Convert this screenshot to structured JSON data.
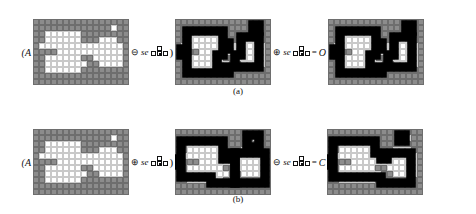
{
  "figure": {
    "domain_note": "morphological opening and closing illustration",
    "cell_px": 6,
    "grid_cols": 16,
    "grid_rows": 11,
    "colors": {
      "background_cell": "#8c8c8c",
      "foreground_cell": "#ffffff",
      "gridline": "#6e6e6e",
      "contour": "#000000",
      "page": "#ffffff"
    }
  },
  "rows": [
    {
      "id": "row-a",
      "caption": "(a)",
      "lead_label": "(A",
      "operators": [
        {
          "id": "op-a-1",
          "symbol": "⊖",
          "symbol_name": "erosion-symbol",
          "se_text": "se",
          "trailing": ")",
          "equals": "",
          "result": ""
        },
        {
          "id": "op-a-2",
          "symbol": "⊕",
          "symbol_name": "dilation-symbol",
          "se_text": "se",
          "trailing": "",
          "equals": "=",
          "result": "O"
        }
      ],
      "panels": [
        {
          "id": "panel-a1",
          "name": "original-set-A",
          "cells": [
            "0000000000000000",
            "0000000000000100",
            "0011111100000000",
            "0011111100011100",
            "0111111111111110",
            "0000111111111110",
            "0011111100111110",
            "0011111110011110",
            "0011111100000000",
            "0000000000000000",
            "0000000000000000"
          ],
          "contours": []
        },
        {
          "id": "panel-a2",
          "name": "erosion-result",
          "cells": [
            "0000000000000000",
            "0000000000000100",
            "0011111100000000",
            "0011111100011100",
            "0111111111111110",
            "0000111111111110",
            "0011111100111110",
            "0011111110011110",
            "0011111100000000",
            "0000000000000000",
            "0000000000000000"
          ],
          "contours": [
            "M 2 2 H 8 V 4 H 9 V 5 H 8 V 6 H 7 V 8 H 9 V 9 H 2 V 6 H 1 V 5 H 2 Z",
            "M 11 3 H 14 V 8 H 10 V 6 H 11 Z",
            "M 13 1 H 14 V 2 H 13 Z"
          ]
        },
        {
          "id": "panel-a3",
          "name": "opening-result-O",
          "cells": [
            "0000000000000000",
            "0000000000000100",
            "0011111100000000",
            "0011111100011100",
            "0111111111111110",
            "0000111111111110",
            "0011111100111110",
            "0011111110011110",
            "0011111100000000",
            "0000000000000000",
            "0000000000000000"
          ],
          "contours": [
            "M 2 2 H 8 V 4 H 9 V 5 H 8 V 6 H 7 V 8 H 9 V 9 H 2 V 6 H 1 V 5 H 2 Z",
            "M 11 3 H 14 V 8 H 10 V 6 H 11 Z",
            "M 13 1 H 14 V 2 H 13 Z"
          ]
        }
      ]
    },
    {
      "id": "row-b",
      "caption": "(b)",
      "lead_label": "(A",
      "operators": [
        {
          "id": "op-b-1",
          "symbol": "⊕",
          "symbol_name": "dilation-symbol",
          "se_text": "se",
          "trailing": ")",
          "equals": "",
          "result": ""
        },
        {
          "id": "op-b-2",
          "symbol": "⊖",
          "symbol_name": "erosion-symbol",
          "se_text": "se",
          "trailing": "",
          "equals": "=",
          "result": "C"
        }
      ],
      "panels": [
        {
          "id": "panel-b1",
          "name": "original-set-A",
          "cells": [
            "0000000000000000",
            "0000000000000100",
            "0011111100000000",
            "0011111100011100",
            "0111111111111110",
            "0000111111111110",
            "0011111100111110",
            "0011111110011110",
            "0011111100000000",
            "0000000000000000",
            "0000000000000000"
          ],
          "contours": []
        },
        {
          "id": "panel-b2",
          "name": "dilation-result",
          "cells": [
            "0000000000000000",
            "0000000000000100",
            "0011111100000000",
            "0011111100011100",
            "0111111111111110",
            "0000111111111110",
            "0011111100111110",
            "0011111110011110",
            "0011111100000000",
            "0000000000000000",
            "0000000000000000"
          ],
          "contours": [
            "M 1 2 H 8 V 5 H 9 V 4 H 10 V 9 H 6 V 8 H 1 V 6 H 0 V 5 H 1 Z",
            "M 10 4 H 15 V 9 H 10 Z",
            "M 12 1 H 14 V 3 H 12 Z"
          ]
        },
        {
          "id": "panel-b3",
          "name": "closing-result-C",
          "cells": [
            "0000000000000000",
            "0000000000000100",
            "0011111100000000",
            "0011111100011100",
            "0111111111111110",
            "0000111111111110",
            "0011111100111110",
            "0011111110011110",
            "0011111100000000",
            "0000000000000000",
            "0000000000000000"
          ],
          "contours": [
            "M 1 2 H 8 V 4 H 9 V 5 H 10 V 4 H 14 V 9 H 9 V 8 H 6 V 8 H 1 V 6 H 0 V 5 H 1 Z",
            "M 12 1 H 13 V 2 H 12 Z"
          ]
        }
      ]
    }
  ]
}
